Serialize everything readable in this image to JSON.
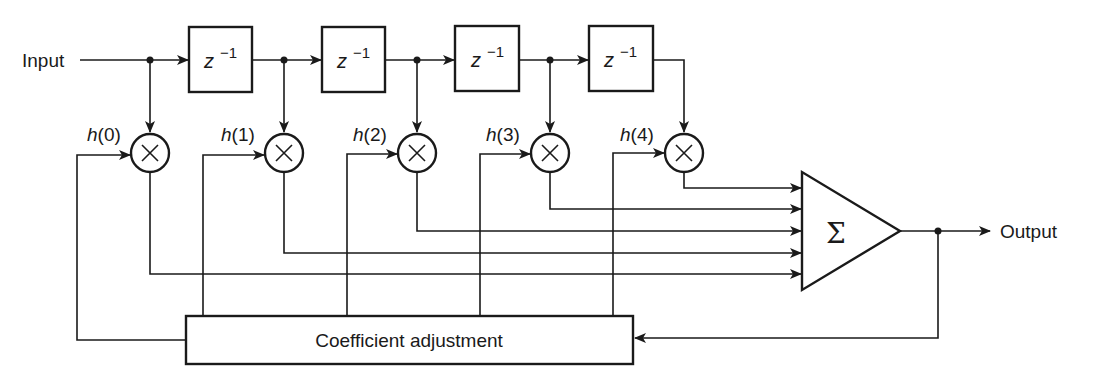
{
  "diagram": {
    "input_label": "Input",
    "output_label": "Output",
    "delay_label_base": "z",
    "delay_label_exp": "−1",
    "delays": [
      {
        "id": "d1",
        "base": "z",
        "exp": "−1"
      },
      {
        "id": "d2",
        "base": "z",
        "exp": "−1"
      },
      {
        "id": "d3",
        "base": "z",
        "exp": "−1"
      },
      {
        "id": "d4",
        "base": "z",
        "exp": "−1"
      }
    ],
    "multipliers": [
      {
        "id": "m0",
        "coef_fn": "h",
        "coef_idx": "(0)",
        "symbol": "×"
      },
      {
        "id": "m1",
        "coef_fn": "h",
        "coef_idx": "(1)",
        "symbol": "×"
      },
      {
        "id": "m2",
        "coef_fn": "h",
        "coef_idx": "(2)",
        "symbol": "×"
      },
      {
        "id": "m3",
        "coef_fn": "h",
        "coef_idx": "(3)",
        "symbol": "×"
      },
      {
        "id": "m4",
        "coef_fn": "h",
        "coef_idx": "(4)",
        "symbol": "×"
      }
    ],
    "summer_symbol": "Σ",
    "adjust_block_label": "Coefficient adjustment",
    "colors": {
      "ink": "#1a1a1a",
      "background": "#ffffff"
    }
  }
}
